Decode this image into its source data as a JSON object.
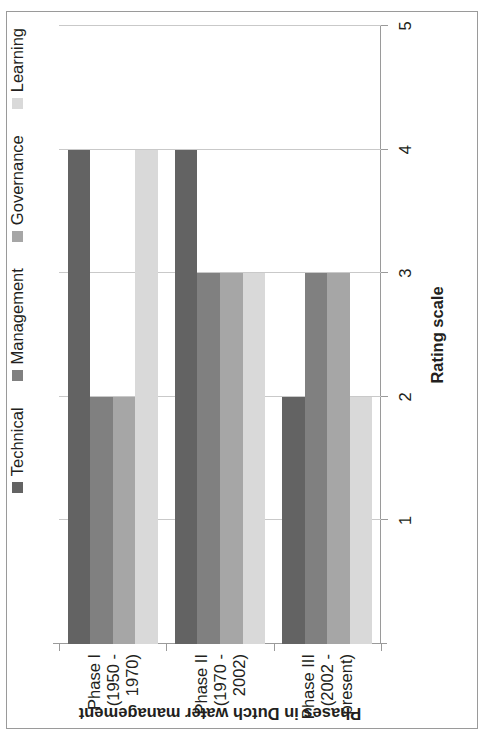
{
  "chart_data": {
    "type": "bar",
    "orientation": "horizontal-rotated",
    "title": "",
    "xlabel": "Phases in Dutch water management",
    "ylabel": "Rating scale",
    "categories": [
      "Phase I (1950 - 1970)",
      "Phase II (1970 - 2002)",
      "Phase III (2002 - present)"
    ],
    "category_lines": [
      [
        "Phase I (1950 - 1970)"
      ],
      [
        "Phase II (1970 - 2002)"
      ],
      [
        "Phase III (2002 -",
        "present)"
      ]
    ],
    "series": [
      {
        "name": "Technical",
        "color": "#636363",
        "values": [
          4,
          4,
          2
        ]
      },
      {
        "name": "Management",
        "color": "#808080",
        "values": [
          2,
          3,
          3
        ]
      },
      {
        "name": "Governance",
        "color": "#a6a6a6",
        "values": [
          2,
          3,
          3
        ]
      },
      {
        "name": "Learning",
        "color": "#d9d9d9",
        "values": [
          4,
          3,
          2
        ]
      }
    ],
    "ylim": [
      0,
      5
    ],
    "yticks": [
      1,
      2,
      3,
      4,
      5
    ],
    "ytick_labels": [
      "1",
      "2",
      "3",
      "4",
      "5"
    ],
    "grid": "value-axis only",
    "legend_position": "top-left (rotated view)",
    "legend_entries": [
      "Technical",
      "Management",
      "Governance",
      "Learning"
    ]
  },
  "axis": {
    "value_title": "Rating scale",
    "category_title": "Phases in Dutch water management"
  }
}
